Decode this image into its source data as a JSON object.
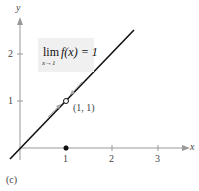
{
  "figure": {
    "panel_label": "(c)",
    "x_axis_label": "x",
    "y_axis_label": "y",
    "x_ticks": [
      "1",
      "2",
      "3"
    ],
    "y_ticks": [
      "1",
      "2"
    ],
    "limit_box": {
      "lim": "lim",
      "subscript": "x→1",
      "expression": "f(x) = 1"
    },
    "point_label": "(1, 1)",
    "line_color": "#111111",
    "axis_color": "#888888"
  }
}
